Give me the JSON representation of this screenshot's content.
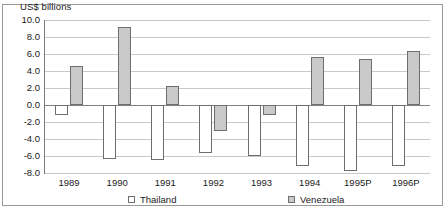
{
  "chart_data": {
    "type": "bar",
    "title": "",
    "axis_title": "US$ billions",
    "xlabel": "",
    "ylabel": "US$ billions",
    "ylim": [
      -8.0,
      10.0
    ],
    "ytick_step": 2.0,
    "yticks": [
      "10.0",
      "8.0",
      "6.0",
      "4.0",
      "2.0",
      "0.0",
      "-2.0",
      "-4.0",
      "-6.0",
      "-8.0"
    ],
    "ytick_values": [
      10.0,
      8.0,
      6.0,
      4.0,
      2.0,
      0.0,
      -2.0,
      -4.0,
      -6.0,
      -8.0
    ],
    "grid": true,
    "legend_position": "bottom",
    "categories": [
      "1989",
      "1990",
      "1991",
      "1992",
      "1993",
      "1994",
      "1995P",
      "1996P"
    ],
    "series": [
      {
        "name": "Thailand",
        "color": "#ffffff",
        "values": [
          -1.2,
          -6.4,
          -6.5,
          -5.6,
          -6.0,
          -7.2,
          -7.8,
          -7.2
        ]
      },
      {
        "name": "Venezuela",
        "color": "#c9c9c9",
        "values": [
          4.6,
          9.2,
          2.2,
          -3.0,
          -1.2,
          5.6,
          5.4,
          6.3
        ]
      }
    ]
  },
  "legend": {
    "items": [
      {
        "label": "Thailand",
        "swatch": "thailand"
      },
      {
        "label": "Venezuela",
        "swatch": "venezuela"
      }
    ]
  }
}
